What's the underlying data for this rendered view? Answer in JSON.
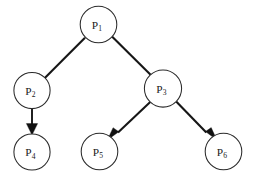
{
  "diagram": {
    "type": "directed-tree",
    "background_color": "#ffffff",
    "node_fill_color": "#ffffff",
    "node_stroke_color": "#2b2b2b",
    "edge_color": "#161616",
    "label_color": "#1a1a1a",
    "node_radius": 18,
    "nodes": [
      {
        "id": "P1",
        "base": "P",
        "subscript": "1",
        "label": "P1",
        "cx": 98.5,
        "cy": 24.5,
        "r": 18.3
      },
      {
        "id": "P2",
        "base": "P",
        "subscript": "2",
        "label": "P2",
        "cx": 32.0,
        "cy": 90.5,
        "r": 18.1
      },
      {
        "id": "P3",
        "base": "P",
        "subscript": "3",
        "label": "P3",
        "cx": 163.0,
        "cy": 88.5,
        "r": 18.6
      },
      {
        "id": "P4",
        "base": "P",
        "subscript": "4",
        "label": "P4",
        "cx": 32.0,
        "cy": 152.0,
        "r": 18.1
      },
      {
        "id": "P5",
        "base": "P",
        "subscript": "5",
        "label": "P5",
        "cx": 99.5,
        "cy": 151.5,
        "r": 18.3
      },
      {
        "id": "P6",
        "base": "P",
        "subscript": "6",
        "label": "P6",
        "cx": 223.5,
        "cy": 151.5,
        "r": 18.3
      }
    ],
    "edges": [
      {
        "id": "e1",
        "from": "P1",
        "to": "P2",
        "directed": true
      },
      {
        "id": "e2",
        "from": "P1",
        "to": "P3",
        "directed": true
      },
      {
        "id": "e3",
        "from": "P2",
        "to": "P4",
        "directed": true
      },
      {
        "id": "e4",
        "from": "P3",
        "to": "P5",
        "directed": true
      },
      {
        "id": "e5",
        "from": "P3",
        "to": "P6",
        "directed": true
      }
    ]
  }
}
